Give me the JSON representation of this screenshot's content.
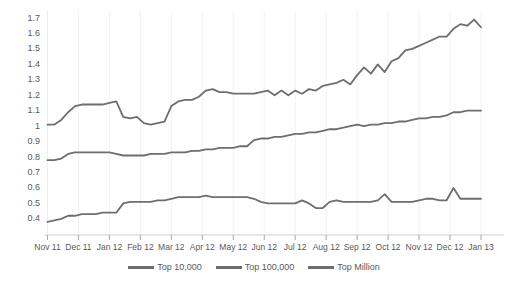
{
  "chart_data": {
    "type": "line",
    "title": "",
    "subtitle": "",
    "xlabel": "",
    "ylabel": "",
    "grid": "vertical-only",
    "legend_position": "bottom-center",
    "ylim": [
      0.35,
      1.75
    ],
    "ytick_labels": [
      "1.7",
      "1.6",
      "1.5",
      "1.4",
      "1.3",
      "1.2",
      "1.1",
      "1",
      "0.9",
      "0.8",
      "0.7",
      "0.6",
      "0.5",
      "0.4"
    ],
    "ytick_values": [
      1.7,
      1.6,
      1.5,
      1.4,
      1.3,
      1.2,
      1.1,
      1.0,
      0.9,
      0.8,
      0.7,
      0.6,
      0.5,
      0.4
    ],
    "xtick_labels": [
      "Nov 11",
      "Dec 11",
      "Jan 12",
      "Feb 12",
      "Mar 12",
      "Apr 12",
      "May 12",
      "Jun 12",
      "Jul 12",
      "Aug 12",
      "Sep 12",
      "Oct 12",
      "Nov 12",
      "Dec 12",
      "Jan 13"
    ],
    "x_count": 64,
    "series": [
      {
        "name": "Top 10,000",
        "color": "#6e6e6e",
        "values": [
          1.01,
          1.01,
          1.04,
          1.09,
          1.13,
          1.14,
          1.14,
          1.14,
          1.14,
          1.15,
          1.16,
          1.06,
          1.05,
          1.06,
          1.02,
          1.01,
          1.02,
          1.03,
          1.13,
          1.16,
          1.17,
          1.17,
          1.19,
          1.23,
          1.24,
          1.22,
          1.22,
          1.21,
          1.21,
          1.21,
          1.21,
          1.22,
          1.23,
          1.2,
          1.23,
          1.2,
          1.23,
          1.21,
          1.24,
          1.23,
          1.26,
          1.27,
          1.28,
          1.3,
          1.27,
          1.33,
          1.38,
          1.34,
          1.4,
          1.35,
          1.42,
          1.44,
          1.49,
          1.5,
          1.52,
          1.54,
          1.56,
          1.58,
          1.58,
          1.63,
          1.66,
          1.65,
          1.69,
          1.64
        ]
      },
      {
        "name": "Top 100,000",
        "color": "#6e6e6e",
        "values": [
          0.78,
          0.78,
          0.79,
          0.82,
          0.83,
          0.83,
          0.83,
          0.83,
          0.83,
          0.83,
          0.82,
          0.81,
          0.81,
          0.81,
          0.81,
          0.82,
          0.82,
          0.82,
          0.83,
          0.83,
          0.83,
          0.84,
          0.84,
          0.85,
          0.85,
          0.86,
          0.86,
          0.86,
          0.87,
          0.87,
          0.91,
          0.92,
          0.92,
          0.93,
          0.93,
          0.94,
          0.95,
          0.95,
          0.96,
          0.96,
          0.97,
          0.98,
          0.98,
          0.99,
          1.0,
          1.01,
          1.0,
          1.01,
          1.01,
          1.02,
          1.02,
          1.03,
          1.03,
          1.04,
          1.05,
          1.05,
          1.06,
          1.06,
          1.07,
          1.09,
          1.09,
          1.1,
          1.1,
          1.1
        ]
      },
      {
        "name": "Top Million",
        "color": "#6e6e6e",
        "values": [
          0.38,
          0.39,
          0.4,
          0.42,
          0.42,
          0.43,
          0.43,
          0.43,
          0.44,
          0.44,
          0.44,
          0.5,
          0.51,
          0.51,
          0.51,
          0.51,
          0.52,
          0.52,
          0.53,
          0.54,
          0.54,
          0.54,
          0.54,
          0.55,
          0.54,
          0.54,
          0.54,
          0.54,
          0.54,
          0.54,
          0.53,
          0.51,
          0.5,
          0.5,
          0.5,
          0.5,
          0.5,
          0.52,
          0.5,
          0.47,
          0.47,
          0.51,
          0.52,
          0.51,
          0.51,
          0.51,
          0.51,
          0.51,
          0.52,
          0.56,
          0.51,
          0.51,
          0.51,
          0.51,
          0.52,
          0.53,
          0.53,
          0.52,
          0.52,
          0.6,
          0.53,
          0.53,
          0.53,
          0.53
        ]
      }
    ],
    "legend": [
      {
        "label": "Top 10,000",
        "color": "#6e6e6e"
      },
      {
        "label": "Top 100,000",
        "color": "#6e6e6e"
      },
      {
        "label": "Top Million",
        "color": "#6e6e6e"
      }
    ]
  }
}
